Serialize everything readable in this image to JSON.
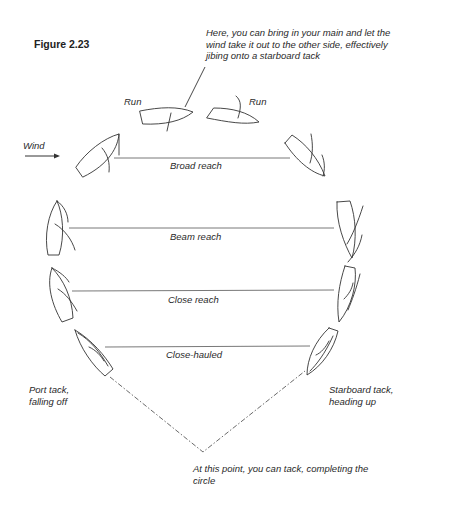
{
  "figure": {
    "title": "Figure 2.23",
    "wind_label": "Wind",
    "annotations": {
      "jibe_note": [
        "Here, you can bring in your main and let the",
        "wind take it out to the other side, effectively",
        "jibing onto a starboard tack"
      ],
      "tack_note": [
        "At this point, you can tack, completing the",
        "circle"
      ],
      "port_tack": [
        "Port tack,",
        "falling off"
      ],
      "starboard_tack": [
        "Starboard tack,",
        "heading up"
      ]
    },
    "points_of_sail": [
      {
        "label": "Run",
        "side": "port"
      },
      {
        "label": "Run",
        "side": "starboard"
      },
      {
        "label": "Broad reach"
      },
      {
        "label": "Beam reach"
      },
      {
        "label": "Close reach"
      },
      {
        "label": "Close-hauled"
      }
    ]
  }
}
